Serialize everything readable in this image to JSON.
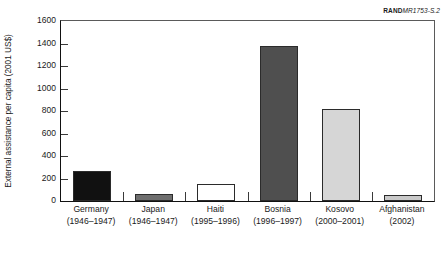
{
  "figure_id": {
    "rand_mark": "RAND",
    "doc_number": "MR1753-S.2"
  },
  "chart_data": {
    "type": "bar",
    "title": "",
    "xlabel": "",
    "ylabel": "External assistance per capita (2001 US$)",
    "ylim": [
      0,
      1600
    ],
    "ytick_step": 200,
    "yticks": [
      "0",
      "200",
      "400",
      "600",
      "800",
      "1000",
      "1200",
      "1400",
      "1600"
    ],
    "grid": false,
    "legend": null,
    "categories": [
      "Germany",
      "Japan",
      "Haiti",
      "Bosnia",
      "Kosovo",
      "Afghanistan"
    ],
    "periods": [
      "(1946–1947)",
      "(1946–1947)",
      "(1995–1996)",
      "(1996–1997)",
      "(2000–2001)",
      "(2002)"
    ],
    "values": [
      265,
      60,
      150,
      1380,
      815,
      50
    ],
    "bar_colors": [
      "#111111",
      "#6e6e6e",
      "#ffffff",
      "#4f4f4f",
      "#d6d6d6",
      "#c9c9c9"
    ]
  }
}
